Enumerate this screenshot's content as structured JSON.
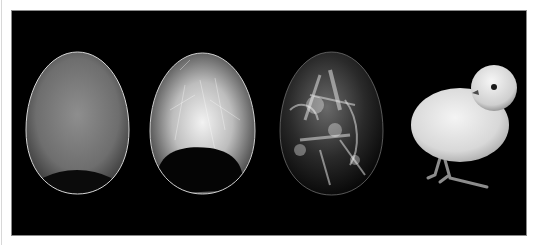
{
  "image": {
    "description": "Egg candling sequence showing embryo development from early stage to hatched chick",
    "background_color": "#000000",
    "frame_color": "#ffffff",
    "stages": [
      {
        "label": "early-egg",
        "glow_color": "#8a8a8a",
        "air_cell_color": "#0b0b0b"
      },
      {
        "label": "developing-egg",
        "glow_color": "#dcdcdc",
        "air_cell_color": "#050505"
      },
      {
        "label": "late-stage-egg",
        "glow_color": "#c8c8c8"
      },
      {
        "label": "hatched-chick",
        "fluff_color": "#e6e6e6"
      }
    ]
  }
}
